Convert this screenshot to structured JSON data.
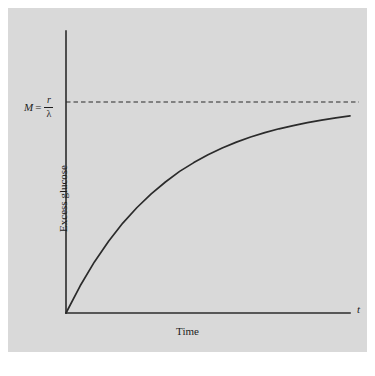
{
  "figure": {
    "panel_background": "#d9d9d9",
    "page_background": "#ffffff",
    "ink_color": "#2b2b2b"
  },
  "labels": {
    "yaxis_title": "Excess glucose",
    "xaxis_title": "Time",
    "time_variable": "t",
    "asymptote_symbol": "M",
    "equals_sign": "=",
    "asymptote_numerator": "r",
    "asymptote_denominator": "λ"
  },
  "chart_data": {
    "type": "line",
    "title": "",
    "xlabel": "Time",
    "ylabel": "Excess glucose",
    "grid": false,
    "legend": null,
    "axes": {
      "x_tick_labels": [],
      "y_tick_labels": [
        "M = r/λ"
      ],
      "x_axis_variable": "t",
      "xlim": [
        0,
        1
      ],
      "ylim": [
        0,
        1.12
      ],
      "x_arrow": false,
      "y_arrow": false
    },
    "annotations": [
      {
        "name": "asymptote",
        "text": "M = r/λ",
        "style": "dashed-horizontal-line",
        "y": 1.0
      }
    ],
    "series": [
      {
        "name": "Excess glucose",
        "equation": "y = M (1 - e^(-λ t))",
        "asymptote": 1.0,
        "style": "solid",
        "x": [
          0.0,
          0.05,
          0.1,
          0.15,
          0.2,
          0.25,
          0.3,
          0.35,
          0.4,
          0.45,
          0.5,
          0.55,
          0.6,
          0.65,
          0.7,
          0.75,
          0.8,
          0.85,
          0.9,
          0.95,
          1.0
        ],
        "y": [
          0.0,
          0.129,
          0.242,
          0.34,
          0.426,
          0.5,
          0.565,
          0.621,
          0.671,
          0.713,
          0.75,
          0.782,
          0.81,
          0.834,
          0.855,
          0.873,
          0.888,
          0.902,
          0.914,
          0.925,
          0.934
        ]
      }
    ]
  }
}
